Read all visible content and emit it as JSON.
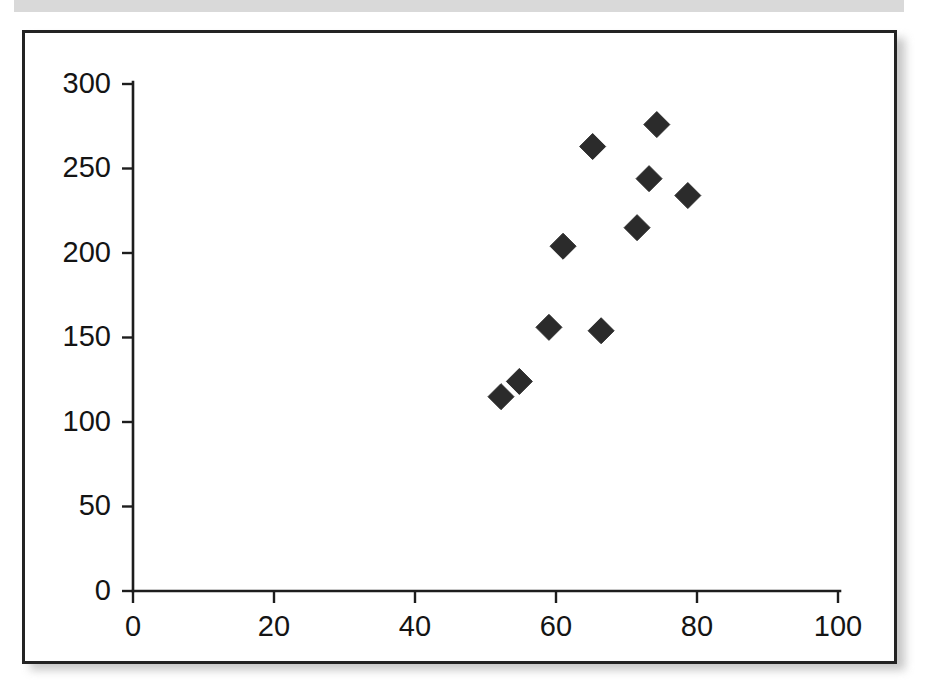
{
  "figure": {
    "background_color": "#ffffff",
    "frame_color": "#232323",
    "marker_color": "#2b2b2b",
    "axis_color": "#1d1d1d",
    "scan_band_color": "#d9d9d9"
  },
  "chart_data": {
    "type": "scatter",
    "title": "",
    "subtitle": "",
    "xlabel": "",
    "ylabel": "",
    "xlim": [
      0,
      100
    ],
    "ylim": [
      0,
      300
    ],
    "xticks": [
      0,
      20,
      40,
      60,
      80,
      100
    ],
    "yticks": [
      0,
      50,
      100,
      150,
      200,
      250,
      300
    ],
    "xtick_labels": [
      "0",
      "20",
      "40",
      "60",
      "80",
      "100"
    ],
    "ytick_labels": [
      "0",
      "50",
      "100",
      "150",
      "200",
      "250",
      "300"
    ],
    "grid": false,
    "legend": null,
    "legend_position": "none",
    "marker_shape": "diamond",
    "marker_size": 13,
    "series": [
      {
        "name": "series-1",
        "points": [
          {
            "x": 52.2,
            "y": 115
          },
          {
            "x": 54.8,
            "y": 124
          },
          {
            "x": 59.0,
            "y": 156
          },
          {
            "x": 61.0,
            "y": 204
          },
          {
            "x": 65.2,
            "y": 263
          },
          {
            "x": 66.4,
            "y": 154
          },
          {
            "x": 71.5,
            "y": 215
          },
          {
            "x": 73.2,
            "y": 244
          },
          {
            "x": 74.3,
            "y": 276
          },
          {
            "x": 78.7,
            "y": 234
          }
        ]
      }
    ]
  }
}
